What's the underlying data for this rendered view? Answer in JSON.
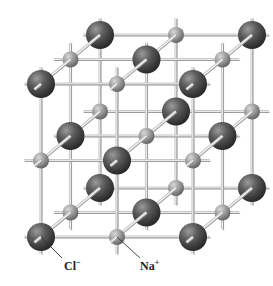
{
  "figure": {
    "labels": {
      "chloride": {
        "symbol": "Cl",
        "charge": "−"
      },
      "sodium": {
        "symbol": "Na",
        "charge": "+"
      }
    },
    "lattice": {
      "size": [
        3,
        3,
        3
      ],
      "origin": [
        41,
        237
      ],
      "step_x": [
        76,
        0
      ],
      "step_y": [
        0,
        -76.5
      ],
      "step_z": [
        29.5,
        -24.5
      ],
      "cl_radius": 14,
      "na_radius": 8,
      "cl_color": "#555555",
      "na_color": "#9a9a9a",
      "rod_color": "#c8c8c8"
    },
    "leaders": {
      "chloride": {
        "from": [
          41,
          237
        ],
        "to": [
          62,
          258
        ]
      },
      "sodium": {
        "from": [
          117,
          237
        ],
        "to": [
          140,
          258
        ]
      }
    }
  }
}
